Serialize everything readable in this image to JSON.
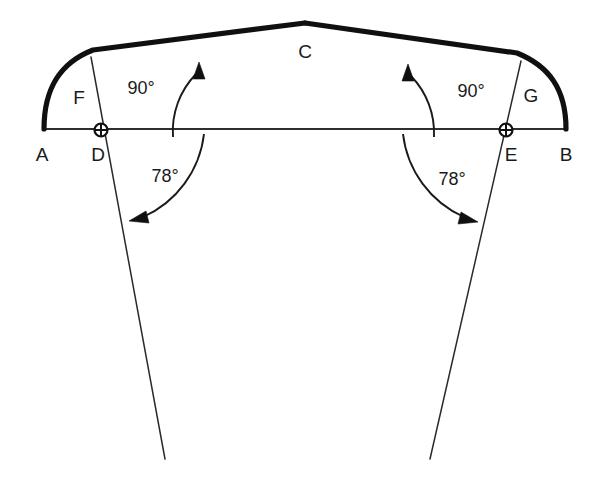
{
  "figure": {
    "background_color": "#ffffff",
    "ink_color": "#101010",
    "points": {
      "A": {
        "label": "A",
        "x": 44,
        "y": 128,
        "label_x": 42,
        "label_y": 156
      },
      "B": {
        "label": "B",
        "x": 566,
        "y": 128,
        "label_x": 566,
        "label_y": 156
      },
      "C": {
        "label": "C",
        "x": 305,
        "y": 22,
        "label_x": 305,
        "label_y": 53
      },
      "D": {
        "label": "D",
        "x": 101,
        "y": 130,
        "label_x": 98,
        "label_y": 156
      },
      "E": {
        "label": "E",
        "x": 506,
        "y": 130,
        "label_x": 511,
        "label_y": 156
      },
      "F": {
        "label": "F",
        "x": 93,
        "y": 96,
        "label_x": 79,
        "label_y": 99
      },
      "G": {
        "label": "G",
        "x": 517,
        "y": 92,
        "label_x": 531,
        "label_y": 97
      }
    },
    "angles": [
      {
        "id": "angle-left-90",
        "value": "90°",
        "x": 141,
        "y": 89,
        "vertex": "D",
        "measure": 90
      },
      {
        "id": "angle-right-90",
        "value": "90°",
        "x": 471,
        "y": 92,
        "vertex": "E",
        "measure": 90
      },
      {
        "id": "angle-left-78",
        "value": "78°",
        "x": 165,
        "y": 177,
        "vertex": "D",
        "measure": 78
      },
      {
        "id": "angle-right-78",
        "value": "78°",
        "x": 452,
        "y": 180,
        "vertex": "E",
        "measure": 78
      }
    ],
    "elements": {
      "arc_left": "curved thick arc from A to C passing near F",
      "arc_right": "curved thick arc from C to B passing near G",
      "baseline": "horizontal thin line A to B through D and E",
      "ray_left": "thin line through D extending below to lower left",
      "ray_right": "thin line through E extending below to lower right",
      "station_marker": "circle with crosshair at D and E"
    }
  }
}
